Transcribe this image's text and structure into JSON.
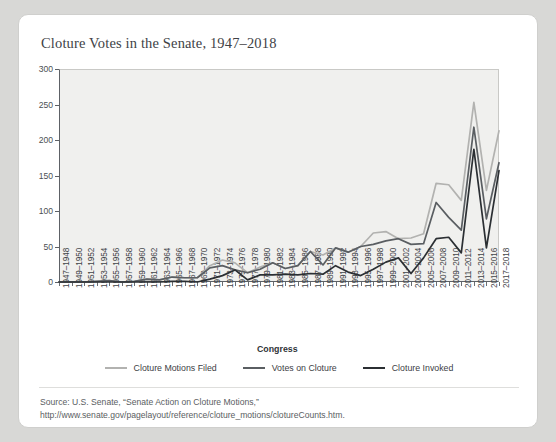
{
  "card": {
    "title": "Cloture Votes in the Senate, 1947–2018",
    "source_note": "Source: U.S. Senate, “Senate Action on Cloture Motions,” http://www.senate.gov/pagelayout/reference/cloture_motions/clotureCounts.htm."
  },
  "colors": {
    "card_background": "#ffffff",
    "page_background": "#d8d8d6",
    "plot_background": "#f0f0ee",
    "axis": "#5d6166",
    "series_filed": "#b2b2b0",
    "series_votes": "#5a5e62",
    "series_invoked": "#2b2f33"
  },
  "chart_data": {
    "type": "line",
    "title": "Cloture Votes in the Senate, 1947–2018",
    "xlabel": "Congress",
    "ylabel": "",
    "ylim": [
      0,
      300
    ],
    "yticks": [
      0,
      50,
      100,
      150,
      200,
      250,
      300
    ],
    "grid": false,
    "legend_position": "bottom",
    "categories": [
      "1947–1948",
      "1949–1950",
      "1951–1952",
      "1953–1954",
      "1955–1956",
      "1957–1958",
      "1959–1960",
      "1961–1962",
      "1963–1964",
      "1965–1966",
      "1967–1968",
      "1969–1970",
      "1971–1972",
      "1973–1974",
      "1975–1976",
      "1977–1978",
      "1979–1980",
      "1981–1982",
      "1983–1984",
      "1985–1986",
      "1987–1988",
      "1989–1990",
      "1991–1992",
      "1993–1994",
      "1995–1996",
      "1997–1998",
      "1999–2000",
      "2001–2002",
      "2003–2004",
      "2005–2006",
      "2007–2008",
      "2009–2010",
      "2011–2012",
      "2013–2014",
      "2015–2016",
      "2017–2018"
    ],
    "series": [
      {
        "name": "Cloture Motions Filed",
        "color": "#b2b2b0",
        "values": [
          0,
          0,
          0,
          1,
          2,
          0,
          1,
          4,
          3,
          7,
          6,
          6,
          23,
          31,
          27,
          13,
          21,
          27,
          19,
          23,
          43,
          38,
          48,
          42,
          50,
          69,
          71,
          61,
          62,
          68,
          139,
          137,
          115,
          253,
          129,
          213
        ]
      },
      {
        "name": "Votes on Cloture",
        "color": "#5a5e62",
        "values": [
          0,
          0,
          0,
          1,
          2,
          0,
          1,
          4,
          3,
          7,
          6,
          6,
          20,
          23,
          17,
          13,
          18,
          27,
          19,
          23,
          43,
          24,
          48,
          42,
          50,
          53,
          58,
          61,
          53,
          54,
          112,
          91,
          73,
          218,
          89,
          168
        ]
      },
      {
        "name": "Cloture Invoked",
        "color": "#2b2f33",
        "values": [
          0,
          0,
          0,
          0,
          0,
          0,
          0,
          0,
          0,
          1,
          1,
          0,
          4,
          9,
          17,
          3,
          10,
          10,
          11,
          10,
          12,
          11,
          23,
          14,
          9,
          18,
          28,
          34,
          12,
          34,
          61,
          63,
          41,
          187,
          48,
          157
        ]
      }
    ]
  },
  "legend": [
    {
      "label": "Cloture Motions Filed",
      "color": "#b2b2b0"
    },
    {
      "label": "Votes on Cloture",
      "color": "#5a5e62"
    },
    {
      "label": "Cloture Invoked",
      "color": "#2b2f33"
    }
  ]
}
